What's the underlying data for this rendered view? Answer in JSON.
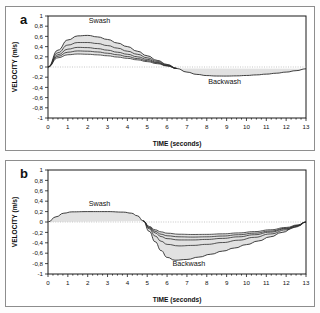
{
  "figure": {
    "panels": [
      {
        "id": "a",
        "label": "a",
        "xlabel": "TIME (seconds)",
        "ylabel": "VELOCITY (m/s)",
        "annotations": [
          {
            "text": "Swash",
            "x": 2.6,
            "y": 0.86
          },
          {
            "text": "Backwash",
            "x": 8.9,
            "y": -0.33
          }
        ]
      },
      {
        "id": "b",
        "label": "b",
        "xlabel": "TIME (seconds)",
        "ylabel": "VELOCITY (m/s)",
        "annotations": [
          {
            "text": "Swash",
            "x": 2.6,
            "y": 0.3
          },
          {
            "text": "Backwash",
            "x": 7.1,
            "y": -0.84
          }
        ]
      }
    ]
  },
  "chart_data": [
    {
      "type": "line",
      "panel": "a",
      "title": "",
      "xlabel": "TIME (seconds)",
      "ylabel": "VELOCITY (m/s)",
      "xlim": [
        0,
        13
      ],
      "ylim": [
        -1,
        1
      ],
      "xticks": [
        0,
        1,
        2,
        3,
        4,
        5,
        6,
        7,
        8,
        9,
        10,
        11,
        12,
        13
      ],
      "yticks": [
        -1,
        -0.8,
        -0.6,
        -0.4,
        -0.2,
        0,
        0.2,
        0.4,
        0.6,
        0.8,
        1
      ],
      "ytick_labels": [
        "-1",
        "-0,8",
        "-0,6",
        "-0,4",
        "-0,2",
        "0",
        "0,2",
        "0,4",
        "0,6",
        "0,8",
        "1"
      ],
      "grid": false,
      "zero_line": true,
      "shaded_band": true,
      "legend": "none",
      "series": [
        {
          "name": "swash-envelope-upper",
          "x": [
            0,
            0.5,
            1,
            1.5,
            2,
            2.5,
            3,
            3.5,
            4,
            4.5,
            5,
            5.5,
            6,
            6.5,
            7,
            7.5,
            8,
            8.5,
            9,
            9.5,
            10,
            10.5,
            11,
            11.5,
            12,
            12.5,
            13
          ],
          "values": [
            0,
            0.33,
            0.53,
            0.61,
            0.62,
            0.59,
            0.54,
            0.47,
            0.4,
            0.31,
            0.22,
            0.13,
            0.05,
            -0.03,
            -0.1,
            -0.145,
            -0.168,
            -0.177,
            -0.178,
            -0.174,
            -0.166,
            -0.155,
            -0.14,
            -0.122,
            -0.1,
            -0.072,
            -0.035
          ]
        },
        {
          "name": "swash-curve-2",
          "x": [
            0,
            0.5,
            1,
            1.5,
            2,
            2.5,
            3,
            3.5,
            4,
            4.5,
            5,
            5.5,
            6,
            6.5
          ],
          "values": [
            0,
            0.28,
            0.43,
            0.48,
            0.48,
            0.46,
            0.42,
            0.37,
            0.31,
            0.25,
            0.18,
            0.11,
            0.04,
            -0.03
          ]
        },
        {
          "name": "swash-curve-3",
          "x": [
            0,
            0.5,
            1,
            1.5,
            2,
            2.5,
            3,
            3.5,
            4,
            4.5,
            5,
            5.5,
            6,
            6.5
          ],
          "values": [
            0,
            0.24,
            0.35,
            0.385,
            0.38,
            0.36,
            0.33,
            0.29,
            0.25,
            0.2,
            0.15,
            0.09,
            0.03,
            -0.03
          ]
        },
        {
          "name": "swash-curve-4",
          "x": [
            0,
            0.5,
            1,
            1.5,
            2,
            2.5,
            3,
            3.5,
            4,
            4.5,
            5,
            5.5,
            6,
            6.5
          ],
          "values": [
            0,
            0.21,
            0.29,
            0.315,
            0.31,
            0.295,
            0.27,
            0.24,
            0.205,
            0.165,
            0.125,
            0.08,
            0.025,
            -0.03
          ]
        },
        {
          "name": "swash-curve-5",
          "x": [
            0,
            0.5,
            1,
            1.5,
            2,
            2.5,
            3,
            3.5,
            4,
            4.5,
            5,
            5.5,
            6,
            6.5
          ],
          "values": [
            0,
            0.18,
            0.24,
            0.255,
            0.25,
            0.238,
            0.22,
            0.195,
            0.17,
            0.14,
            0.105,
            0.065,
            0.02,
            -0.03
          ]
        }
      ]
    },
    {
      "type": "line",
      "panel": "b",
      "title": "",
      "xlabel": "TIME (seconds)",
      "ylabel": "VELOCITY (m/s)",
      "xlim": [
        0,
        13
      ],
      "ylim": [
        -1,
        1
      ],
      "xticks": [
        0,
        1,
        2,
        3,
        4,
        5,
        6,
        7,
        8,
        9,
        10,
        11,
        12,
        13
      ],
      "yticks": [
        -1,
        -0.8,
        -0.6,
        -0.4,
        -0.2,
        0,
        0.2,
        0.4,
        0.6,
        0.8,
        1
      ],
      "ytick_labels": [
        "-1",
        "-0,8",
        "-0,6",
        "-0,4",
        "-0,2",
        "0",
        "0,2",
        "0,4",
        "0,6",
        "0,8",
        "1"
      ],
      "grid": false,
      "zero_line": true,
      "shaded_band": true,
      "legend": "none",
      "series": [
        {
          "name": "backwash-envelope-lower",
          "x": [
            0,
            0.4,
            0.8,
            1.2,
            2,
            3,
            3.8,
            4.2,
            4.5,
            4.8,
            5.1,
            5.4,
            5.7,
            6,
            6.4,
            7,
            7.6,
            8.2,
            8.8,
            9.4,
            10,
            10.6,
            11.2,
            11.8,
            12.4,
            13
          ],
          "values": [
            0,
            0.1,
            0.17,
            0.195,
            0.2,
            0.2,
            0.19,
            0.17,
            0.12,
            0.02,
            -0.18,
            -0.38,
            -0.55,
            -0.68,
            -0.735,
            -0.72,
            -0.675,
            -0.62,
            -0.56,
            -0.5,
            -0.435,
            -0.365,
            -0.285,
            -0.2,
            -0.105,
            0
          ]
        },
        {
          "name": "backwash-curve-2",
          "x": [
            4.8,
            5.1,
            5.4,
            5.7,
            6,
            6.6,
            7.3,
            8,
            8.8,
            9.6,
            10.4,
            11.2,
            12,
            12.6,
            13
          ],
          "values": [
            0.02,
            -0.13,
            -0.27,
            -0.37,
            -0.43,
            -0.46,
            -0.45,
            -0.43,
            -0.395,
            -0.35,
            -0.295,
            -0.23,
            -0.15,
            -0.08,
            0
          ]
        },
        {
          "name": "backwash-curve-3",
          "x": [
            4.8,
            5.1,
            5.4,
            5.7,
            6,
            6.6,
            7.3,
            8,
            8.8,
            9.6,
            10.4,
            11.2,
            12,
            12.6,
            13
          ],
          "values": [
            0.02,
            -0.11,
            -0.21,
            -0.28,
            -0.32,
            -0.345,
            -0.345,
            -0.335,
            -0.315,
            -0.285,
            -0.245,
            -0.195,
            -0.13,
            -0.07,
            0
          ]
        },
        {
          "name": "backwash-curve-4",
          "x": [
            4.8,
            5.1,
            5.4,
            5.7,
            6,
            6.6,
            7.3,
            8,
            8.8,
            9.6,
            10.4,
            11.2,
            12,
            12.6,
            13
          ],
          "values": [
            0.02,
            -0.1,
            -0.18,
            -0.235,
            -0.265,
            -0.285,
            -0.29,
            -0.285,
            -0.27,
            -0.245,
            -0.215,
            -0.175,
            -0.12,
            -0.065,
            0
          ]
        },
        {
          "name": "backwash-curve-5",
          "x": [
            4.8,
            5.1,
            5.4,
            5.7,
            6,
            6.6,
            7.3,
            8,
            8.8,
            9.6,
            10.4,
            11.2,
            12,
            12.6,
            13
          ],
          "values": [
            0.02,
            -0.085,
            -0.15,
            -0.19,
            -0.215,
            -0.235,
            -0.24,
            -0.238,
            -0.228,
            -0.21,
            -0.185,
            -0.15,
            -0.105,
            -0.055,
            0
          ]
        }
      ]
    }
  ]
}
